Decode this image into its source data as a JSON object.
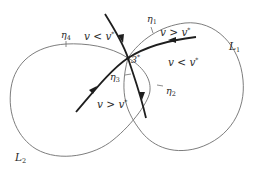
{
  "diagram": {
    "curves": {
      "L1": {
        "label": "L",
        "sub": "1"
      },
      "L2": {
        "label": "L",
        "sub": "2"
      }
    },
    "points": {
      "eta1": {
        "label": "η",
        "sub": "1"
      },
      "eta2": {
        "label": "η",
        "sub": "2"
      },
      "eta3": {
        "label": "η",
        "sub": "3"
      },
      "eta4": {
        "label": "η",
        "sub": "4"
      },
      "center": {
        "label": "3",
        "sup": "*"
      }
    },
    "regions": {
      "top_left": {
        "text": "v < v",
        "sup": "*"
      },
      "top_right": {
        "text": "v > v",
        "sup": "*"
      },
      "right": {
        "text": "v < v",
        "sup": "*"
      },
      "bottom_left": {
        "text": "v > v",
        "sup": "*"
      }
    },
    "colors": {
      "thin_curve": "#6e6e6e",
      "thick_curve": "#1e1e1e",
      "text": "#2a2a2a"
    }
  }
}
